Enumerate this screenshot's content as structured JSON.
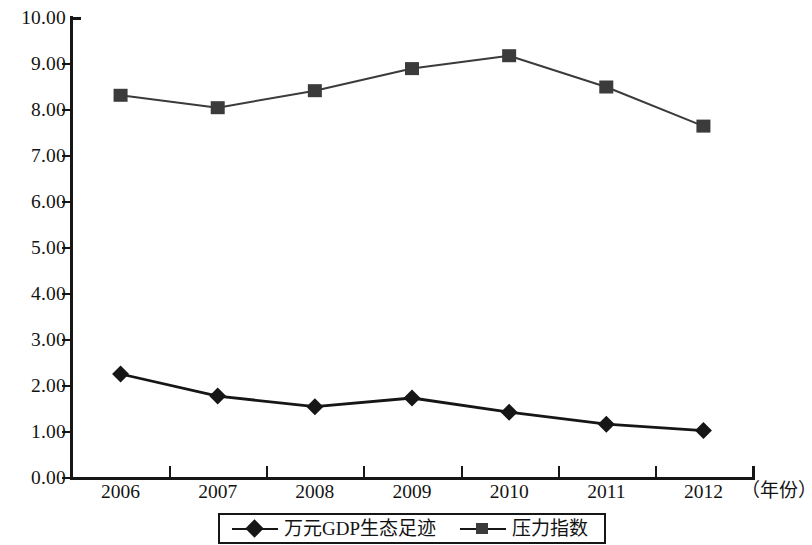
{
  "chart_data": {
    "type": "line",
    "title": "",
    "subtitle": "",
    "xlabel": "（年份）",
    "ylabel": "",
    "categories": [
      "2006",
      "2007",
      "2008",
      "2009",
      "2010",
      "2011",
      "2012"
    ],
    "x": [
      2006,
      2007,
      2008,
      2009,
      2010,
      2011,
      2012
    ],
    "ylim": [
      0.0,
      10.0
    ],
    "ytick_step": 1.0,
    "ytick_labels": [
      "0.00",
      "1.00",
      "2.00",
      "3.00",
      "4.00",
      "5.00",
      "6.00",
      "7.00",
      "8.00",
      "9.00",
      "10.00"
    ],
    "ytick_values": [
      0,
      1,
      2,
      3,
      4,
      5,
      6,
      7,
      8,
      9,
      10
    ],
    "grid": false,
    "legend_position": "bottom",
    "series": [
      {
        "name": "万元GDP生态足迹",
        "marker": "diamond",
        "color": "#161616",
        "values": [
          2.26,
          1.78,
          1.55,
          1.74,
          1.43,
          1.17,
          1.03
        ]
      },
      {
        "name": "压力指数",
        "marker": "square",
        "color": "#3b3b3b",
        "values": [
          8.32,
          8.05,
          8.42,
          8.9,
          9.18,
          8.5,
          7.65
        ]
      }
    ]
  },
  "axis": {
    "unit_label": "（年份）"
  },
  "legend": {
    "entries": [
      {
        "label": "万元GDP生态足迹",
        "marker": "diamond-marker"
      },
      {
        "label": "压力指数",
        "marker": "square-marker"
      }
    ]
  }
}
